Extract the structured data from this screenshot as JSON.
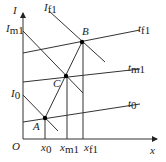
{
  "diagram": {
    "axes": {
      "y_label": "I",
      "x_label": "x",
      "origin_label": "O"
    },
    "y_ticks": [
      {
        "base": "I",
        "sub": "m1"
      },
      {
        "base": "I",
        "sub": "0"
      }
    ],
    "x_ticks": [
      {
        "base": "x",
        "sub": "0"
      },
      {
        "base": "x",
        "sub": "m1"
      },
      {
        "base": "x",
        "sub": "f1"
      }
    ],
    "curve_labels": [
      {
        "base": "I",
        "sub": "f1"
      },
      {
        "base": "t",
        "sub": "f1"
      },
      {
        "base": "t",
        "sub": "m1"
      },
      {
        "base": "t",
        "sub": "0"
      }
    ],
    "points": [
      {
        "label": "A"
      },
      {
        "label": "B"
      },
      {
        "label": "C"
      }
    ],
    "colors": {
      "line": "#333333",
      "point": "#000000"
    }
  }
}
